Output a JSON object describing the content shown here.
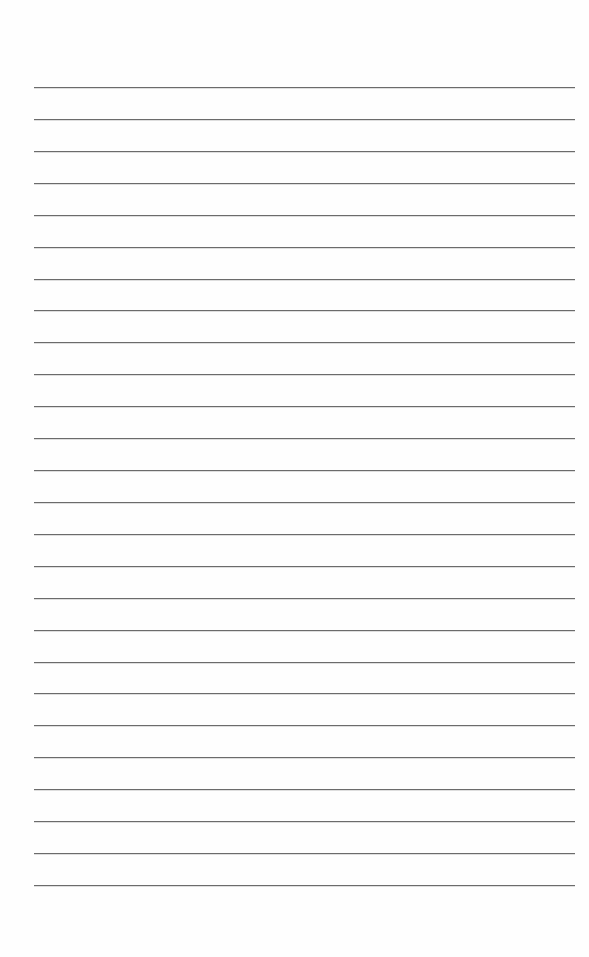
{
  "page": {
    "type": "lined-paper",
    "background_color": "#fefefe",
    "line_color": "#6b6b6b",
    "line_count": 26,
    "first_line_y": 87,
    "line_spacing": 31.92,
    "line_left": 34,
    "line_right": 575,
    "text": []
  }
}
